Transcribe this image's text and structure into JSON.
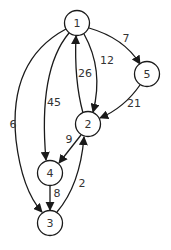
{
  "graph": {
    "type": "directed-weighted",
    "nodes": [
      {
        "id": "1",
        "label": "1",
        "x": 77,
        "y": 23
      },
      {
        "id": "2",
        "label": "2",
        "x": 88,
        "y": 124
      },
      {
        "id": "3",
        "label": "3",
        "x": 50,
        "y": 223
      },
      {
        "id": "4",
        "label": "4",
        "x": 50,
        "y": 173
      },
      {
        "id": "5",
        "label": "5",
        "x": 147,
        "y": 74
      }
    ],
    "edges": [
      {
        "from": "1",
        "to": "5",
        "weight": "7"
      },
      {
        "from": "1",
        "to": "2",
        "weight": "12"
      },
      {
        "from": "2",
        "to": "1",
        "weight": "26"
      },
      {
        "from": "1",
        "to": "4",
        "weight": "45"
      },
      {
        "from": "1",
        "to": "3",
        "weight": "6"
      },
      {
        "from": "5",
        "to": "2",
        "weight": "21"
      },
      {
        "from": "2",
        "to": "4",
        "weight": "9"
      },
      {
        "from": "4",
        "to": "3",
        "weight": "8"
      },
      {
        "from": "3",
        "to": "2",
        "weight": "2"
      }
    ]
  },
  "colors": {
    "stroke": "#1a1a1a",
    "text": "#333333",
    "background": "#ffffff"
  }
}
